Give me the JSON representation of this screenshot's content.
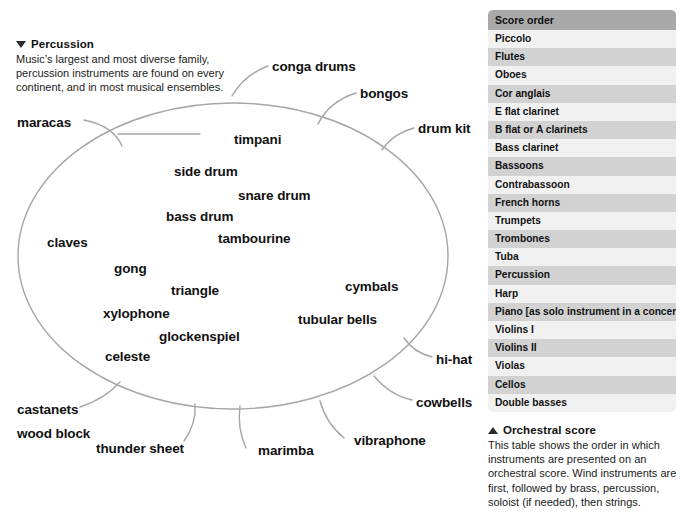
{
  "diagram": {
    "caption": {
      "marker": "triangle-down",
      "title": "Percussion",
      "body": "Music’s largest and most diverse family, percussion instruments are found on every continent, and in most musical ensembles."
    },
    "family_shape": "oval",
    "labels": [
      {
        "id": "conga-drums",
        "text": "conga drums",
        "x": 272,
        "y": 60
      },
      {
        "id": "bongos",
        "text": "bongos",
        "x": 360,
        "y": 87
      },
      {
        "id": "drum-kit",
        "text": "drum kit",
        "x": 418,
        "y": 122
      },
      {
        "id": "maracas",
        "text": "maracas",
        "x": 17,
        "y": 116
      },
      {
        "id": "timpani",
        "text": "timpani",
        "x": 234,
        "y": 133
      },
      {
        "id": "side-drum",
        "text": "side drum",
        "x": 174,
        "y": 165
      },
      {
        "id": "snare-drum",
        "text": "snare drum",
        "x": 238,
        "y": 189
      },
      {
        "id": "bass-drum",
        "text": "bass drum",
        "x": 166,
        "y": 210
      },
      {
        "id": "tambourine",
        "text": "tambourine",
        "x": 218,
        "y": 232
      },
      {
        "id": "claves",
        "text": "claves",
        "x": 47,
        "y": 236
      },
      {
        "id": "gong",
        "text": "gong",
        "x": 114,
        "y": 262
      },
      {
        "id": "triangle",
        "text": "triangle",
        "x": 171,
        "y": 284
      },
      {
        "id": "cymbals",
        "text": "cymbals",
        "x": 345,
        "y": 280
      },
      {
        "id": "xylophone",
        "text": "xylophone",
        "x": 103,
        "y": 307
      },
      {
        "id": "tubular-bells",
        "text": "tubular bells",
        "x": 298,
        "y": 313
      },
      {
        "id": "glockenspiel",
        "text": "glockenspiel",
        "x": 159,
        "y": 330
      },
      {
        "id": "celeste",
        "text": "celeste",
        "x": 105,
        "y": 350
      },
      {
        "id": "hi-hat",
        "text": "hi-hat",
        "x": 436,
        "y": 353
      },
      {
        "id": "cowbells",
        "text": "cowbells",
        "x": 416,
        "y": 396
      },
      {
        "id": "castanets",
        "text": "castanets",
        "x": 17,
        "y": 403
      },
      {
        "id": "wood-block",
        "text": "wood block",
        "x": 17,
        "y": 427
      },
      {
        "id": "thunder-sheet",
        "text": "thunder sheet",
        "x": 96,
        "y": 442
      },
      {
        "id": "marimba",
        "text": "marimba",
        "x": 258,
        "y": 444
      },
      {
        "id": "vibraphone",
        "text": "vibraphone",
        "x": 354,
        "y": 434
      }
    ]
  },
  "score": {
    "header": "Score order",
    "rows": [
      "Piccolo",
      "Flutes",
      "Oboes",
      "Cor anglais",
      "E flat clarinet",
      "B flat or A clarinets",
      "Bass clarinet",
      "Bassoons",
      "Contrabassoon",
      "French horns",
      "Trumpets",
      "Trombones",
      "Tuba",
      "Percussion",
      "Harp",
      "Piano [as solo instrument in a concerto]",
      "Violins I",
      "Violins II",
      "Violas",
      "Cellos",
      "Double basses"
    ],
    "caption": {
      "marker": "triangle-up",
      "title": "Orchestral score",
      "body": "This table shows the order in which instruments are presented on an orchestral score. Wind instruments are first, followed by brass, percussion, soloist (if needed), then strings."
    },
    "colors": {
      "header_bg": "#a9a9a9",
      "row_shade_bg": "#d2d2d2",
      "row_plain_bg": "#f1f1f1",
      "text": "#111111"
    }
  },
  "style": {
    "oval_stroke": "#a6a6a6",
    "leader_stroke": "#a6a6a6",
    "page_bg": "#ffffff"
  }
}
